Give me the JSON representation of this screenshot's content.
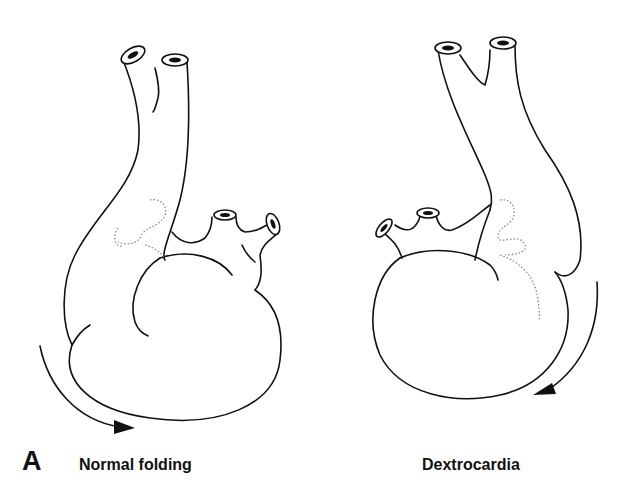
{
  "figure": {
    "panel_label": "A",
    "panels": [
      {
        "id": "left",
        "caption": "Normal folding",
        "rotation_arrow": "clockwise-bottom-left"
      },
      {
        "id": "right",
        "caption": "Dextrocardia",
        "rotation_arrow": "clockwise-bottom-right"
      }
    ],
    "colors": {
      "line": "#111111",
      "dotted": "#777777",
      "background": "#ffffff"
    }
  }
}
